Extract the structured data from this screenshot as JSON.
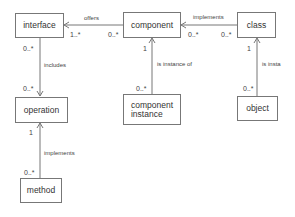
{
  "diagram": {
    "nodes": [
      {
        "id": "interface",
        "label": "interface"
      },
      {
        "id": "component",
        "label": "component"
      },
      {
        "id": "class",
        "label": "class"
      },
      {
        "id": "operation",
        "label": "operation"
      },
      {
        "id": "component_instance",
        "label_line1": "component",
        "label_line2": "instance"
      },
      {
        "id": "object",
        "label": "object"
      },
      {
        "id": "method",
        "label": "method"
      }
    ],
    "edges": [
      {
        "from": "component",
        "to": "interface",
        "label": "offers",
        "source_mult": "0..*",
        "target_mult": "1..*"
      },
      {
        "from": "class",
        "to": "component",
        "label": "implements",
        "source_mult": "0..*",
        "target_mult": "0..*"
      },
      {
        "from": "interface",
        "to": "operation",
        "label": "includes",
        "source_mult": "0..*",
        "target_mult": "0..*"
      },
      {
        "from": "component_instance",
        "to": "component",
        "label": "is instance of",
        "source_mult": "0..*",
        "target_mult": "1"
      },
      {
        "from": "object",
        "to": "class",
        "label": "is insta",
        "source_mult": "0..*",
        "target_mult": "1"
      },
      {
        "from": "method",
        "to": "operation",
        "label": "implements",
        "source_mult": "0..*",
        "target_mult": "1"
      }
    ]
  }
}
